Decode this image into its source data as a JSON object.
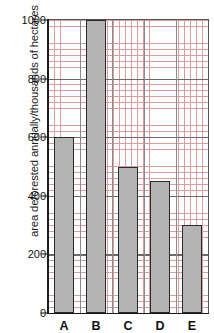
{
  "chart_data": {
    "type": "bar",
    "title": "",
    "xlabel": "",
    "ylabel": "area deforested annually/thousands of hectares",
    "categories": [
      "A",
      "B",
      "C",
      "D",
      "E"
    ],
    "values": [
      600,
      1000,
      500,
      450,
      300
    ],
    "ylim": [
      0,
      1000
    ],
    "y_major_ticks": [
      0,
      200,
      400,
      600,
      800,
      1000
    ],
    "y_minor_step": 20,
    "grid": true,
    "legend": "none",
    "bar_fill_color": "#b4b4b4",
    "bar_outline_color": "#2a2a2a",
    "minor_grid_color": "#d98d8d",
    "major_grid_color": "#6b6b6b",
    "axis_color": "#1a1a1a"
  },
  "axis": {
    "y_tick_labels": [
      "0",
      "200",
      "400",
      "600",
      "800",
      "1000"
    ],
    "x_tick_labels": [
      "A",
      "B",
      "C",
      "D",
      "E"
    ]
  }
}
